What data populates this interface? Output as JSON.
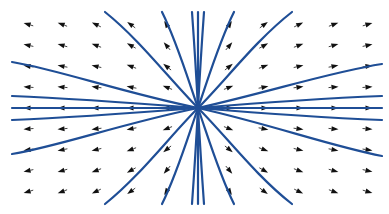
{
  "figure": {
    "type": "vector field with streamlines",
    "title": "",
    "background": "#ffffff",
    "stream_color": "#1f4e96",
    "arrow_color": "#111111",
    "center": {
      "x": 198,
      "y": 108
    }
  },
  "arrow_grid": {
    "columns_x": [
      27,
      61,
      95,
      130,
      166,
      230,
      265,
      300,
      335,
      369
    ],
    "rows_y": [
      24,
      45,
      66,
      87,
      108,
      129,
      150,
      171,
      192
    ]
  },
  "streamlines": [
    "M198 108 C 120 102, 60 98, 12 96",
    "M198 108 C 120 108, 60 108, 12 108",
    "M198 108 C 120 114, 60 118, 12 120",
    "M198 108 C 120 92, 60 70, 12 62",
    "M198 108 C 120 124, 60 146, 12 154",
    "M198 108 C 270 102, 330 98, 382 96",
    "M198 108 C 270 108, 330 108, 382 108",
    "M198 108 C 270 114, 330 118, 382 120",
    "M198 108 C 270 92, 330 72, 382 64",
    "M198 108 C 270 124, 330 146, 382 156",
    "M198 108 C 170 80, 140 40, 105 12",
    "M198 108 C 185 70, 176 40, 162 12",
    "M198 108 C 196 70, 194 40, 192 12",
    "M198 108 C 198 70, 198 40, 198 12",
    "M198 108 C 200 70, 202 40, 204 12",
    "M198 108 C 211 70, 220 40, 234 12",
    "M198 108 C 226 80, 256 40, 292 12",
    "M198 108 C 170 136, 140 176, 105 204",
    "M198 108 C 185 146, 176 176, 162 204",
    "M198 108 C 196 146, 194 176, 192 204",
    "M198 108 C 198 146, 198 176, 198 204",
    "M198 108 C 200 146, 202 176, 204 204",
    "M198 108 C 211 146, 220 176, 234 204",
    "M198 108 C 226 136, 256 176, 292 204"
  ]
}
